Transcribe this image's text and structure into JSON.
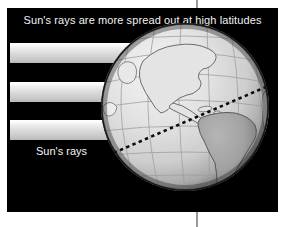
{
  "figure": {
    "title": "Sun's rays are more spread out at high latitudes",
    "rays_label": "Sun's rays",
    "background_color": "#ffffff",
    "panel_color": "#000000",
    "text_color": "#f2f2f2",
    "ray_band_color": "#d7d7d7",
    "globe_ocean_color": "#d9d9d9",
    "globe_land_color": "#a8a8a8",
    "globe_shadow_color": "#4a4a4a",
    "graticule_color": "#9d9d9d",
    "dashed_line_color": "#111111",
    "rule_color": "#9a9a9a"
  },
  "diagram_data": {
    "type": "illustration",
    "subject": "Earth globe lit by parallel sun rays",
    "ray_bands": [
      {
        "index": 1,
        "label": "sun-ray-band-1"
      },
      {
        "index": 2,
        "label": "sun-ray-band-2"
      },
      {
        "index": 3,
        "label": "sun-ray-band-3"
      }
    ],
    "globe_features": [
      "north-america",
      "south-america",
      "greenland",
      "graticule",
      "dashed-latitude-line",
      "terminator-shading"
    ]
  }
}
